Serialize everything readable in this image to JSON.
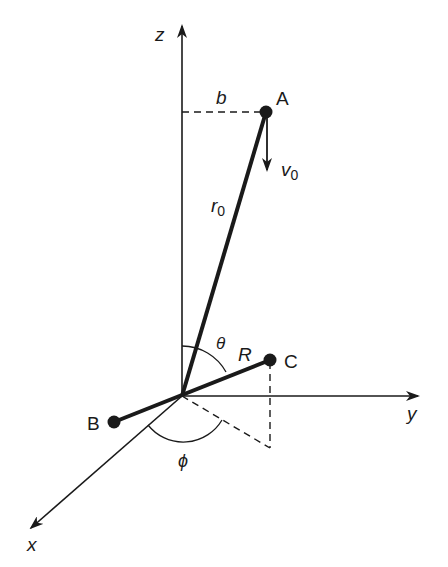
{
  "diagram": {
    "type": "3d-coordinate-geometry",
    "axes": {
      "x": {
        "label": "x"
      },
      "y": {
        "label": "y"
      },
      "z": {
        "label": "z"
      }
    },
    "points": {
      "A": {
        "label": "A"
      },
      "B": {
        "label": "B"
      },
      "C": {
        "label": "C"
      }
    },
    "labels": {
      "impact_parameter": "b",
      "initial_velocity": "v",
      "initial_velocity_sub": "0",
      "initial_distance": "r",
      "initial_distance_sub": "0",
      "polar_angle": "θ",
      "separation": "R",
      "azimuthal_angle": "ϕ"
    },
    "colors": {
      "ink": "#1a1a1a",
      "background": "#ffffff"
    }
  }
}
